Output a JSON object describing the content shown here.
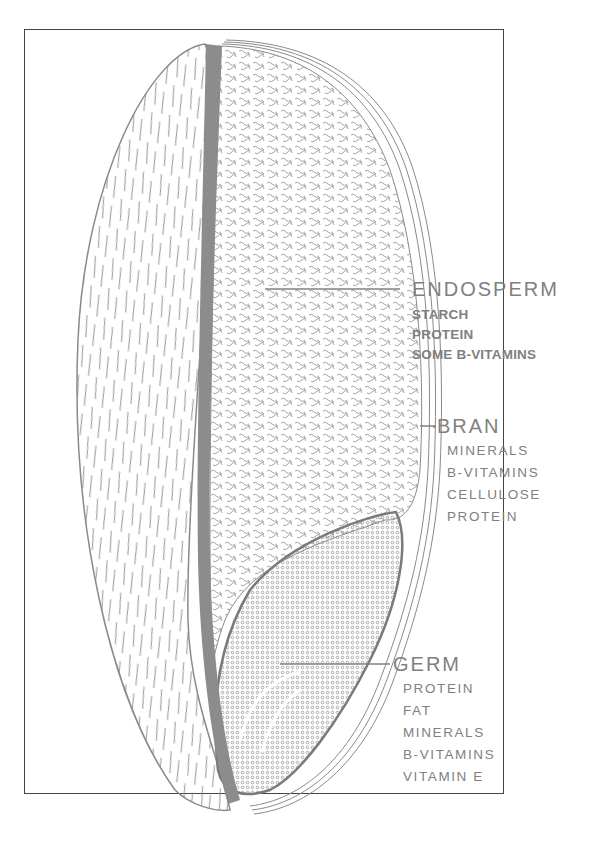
{
  "diagram": {
    "colors": {
      "ink": "#808080",
      "frame": "#444444",
      "seed_coat_band": "#8c8c8c"
    },
    "parts": [
      {
        "name": "ENDOSPERM",
        "components": [
          "STARCH",
          "PROTEIN",
          "SOME B-VITAMINS"
        ]
      },
      {
        "name": "BRAN",
        "components": [
          "MINERALS",
          "B-VITAMINS",
          "CELLULOSE",
          "PROTEIN"
        ]
      },
      {
        "name": "GERM",
        "components": [
          "PROTEIN",
          "FAT",
          "MINERALS",
          "B-VITAMINS",
          "VITAMIN E"
        ]
      }
    ]
  }
}
